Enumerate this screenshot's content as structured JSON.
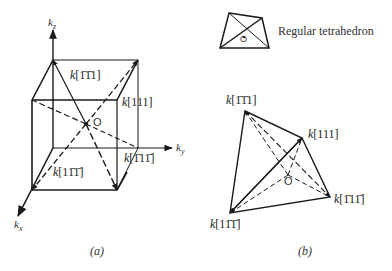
{
  "figure_a": {
    "caption": "(a)",
    "axes": {
      "kz": "k",
      "kz_sub": "z",
      "ky": "k",
      "ky_sub": "y",
      "kx": "k",
      "kx_sub": "x"
    },
    "origin_label": "O",
    "vectors": [
      {
        "label": "k[ŀ1ŀ1 1]",
        "display": "k[1̄1̄1]",
        "direction": "[-1-1 1]"
      },
      {
        "label": "k[111]",
        "display": "k[111]",
        "direction": "[111]"
      },
      {
        "label": "k[1̄1 1̄]",
        "display": "k[1̄11̄]",
        "direction": "[-1 1 -1]"
      },
      {
        "label": "k[1 1̄ 1̄]",
        "display": "k[11̄1̄]",
        "direction": "[1 -1 -1]"
      }
    ]
  },
  "figure_b": {
    "caption": "(b)",
    "legend_label": "Regular tetrahedron",
    "origin_label": "O",
    "vertices": [
      {
        "display": "k[1̄1̄1]"
      },
      {
        "display": "k[111]"
      },
      {
        "display": "k[1̄11̄]"
      },
      {
        "display": "k[11̄1̄]"
      }
    ]
  },
  "labels": {
    "a_v1_k": "k",
    "a_v1_idx": "[1̄1̄1]",
    "a_v2_k": "k",
    "a_v2_idx": "[111]",
    "a_v3_k": "k",
    "a_v3_idx": "[1̄11̄]",
    "a_v4_k": "k",
    "a_v4_idx": "[11̄1̄]",
    "b_v1_k": "k",
    "b_v1_idx": "[1̄1̄1]",
    "b_v2_k": "k",
    "b_v2_idx": "[111]",
    "b_v3_k": "k",
    "b_v3_idx": "[1̄11̄]",
    "b_v4_k": "k",
    "b_v4_idx": "[11̄1̄]"
  },
  "colors": {
    "ink": "#1a1a1a",
    "background": "#ffffff"
  }
}
